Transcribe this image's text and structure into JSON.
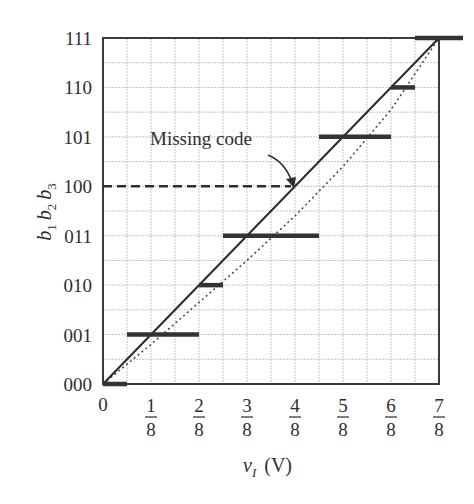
{
  "chart_data": {
    "type": "line",
    "title": "",
    "xlabel": "v_I (V)",
    "ylabel": "b1 b2 b3",
    "xlim": [
      0,
      0.875
    ],
    "ylim": [
      0,
      7
    ],
    "grid": true,
    "grid_minor_step_x": 0.0625,
    "grid_minor_step_y": 0.5,
    "x_ticks": [
      {
        "value": 0,
        "label": "0"
      },
      {
        "value": 0.125,
        "num": "1",
        "den": "8"
      },
      {
        "value": 0.25,
        "num": "2",
        "den": "8"
      },
      {
        "value": 0.375,
        "num": "3",
        "den": "8"
      },
      {
        "value": 0.5,
        "num": "4",
        "den": "8"
      },
      {
        "value": 0.625,
        "num": "5",
        "den": "8"
      },
      {
        "value": 0.75,
        "num": "6",
        "den": "8"
      },
      {
        "value": 0.875,
        "num": "7",
        "den": "8"
      }
    ],
    "y_ticks": [
      "000",
      "001",
      "010",
      "011",
      "100",
      "101",
      "110",
      "111"
    ],
    "series": [
      {
        "name": "Actual transfer characteristic (steps)",
        "style": "thick-solid",
        "steps": [
          {
            "code": "000",
            "x_start": 0,
            "x_end": 0.0625
          },
          {
            "code": "001",
            "x_start": 0.0625,
            "x_end": 0.25
          },
          {
            "code": "010",
            "x_start": 0.25,
            "x_end": 0.3125
          },
          {
            "code": "011",
            "x_start": 0.3125,
            "x_end": 0.5625
          },
          {
            "code": "101",
            "x_start": 0.5625,
            "x_end": 0.75
          },
          {
            "code": "110",
            "x_start": 0.75,
            "x_end": 0.8125
          },
          {
            "code": "111",
            "x_start": 0.8125,
            "x_end": 0.9375
          }
        ]
      },
      {
        "name": "Ideal straight line",
        "style": "solid",
        "x": [
          0,
          0.875
        ],
        "y": [
          0,
          7
        ]
      },
      {
        "name": "Actual characteristic (curve)",
        "style": "dotted",
        "x": [
          0,
          0.125,
          0.25,
          0.375,
          0.5,
          0.625,
          0.75,
          0.875
        ],
        "y": [
          0,
          0.8,
          1.65,
          2.5,
          3.4,
          4.4,
          5.55,
          7
        ]
      },
      {
        "name": "Missing code 100",
        "style": "dashed",
        "code": "100",
        "x_start": 0,
        "x_end": 0.5
      }
    ],
    "annotations": [
      {
        "text": "Missing code",
        "x": 0.3,
        "y": 5.0,
        "arrow_to": {
          "x": 0.5,
          "y": 4
        }
      }
    ]
  },
  "labels": {
    "ylabel_parts": [
      {
        "base": "b",
        "sub": "1"
      },
      {
        "base": "b",
        "sub": "2"
      },
      {
        "base": "b",
        "sub": "3"
      }
    ],
    "xlabel_var": "v",
    "xlabel_sub": "I",
    "xlabel_unit": "(V)",
    "annotation": "Missing code"
  }
}
